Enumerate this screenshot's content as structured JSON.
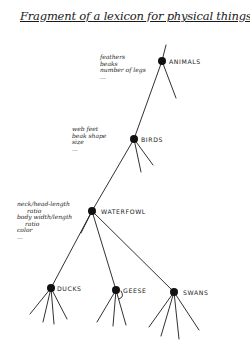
{
  "title": "Fragment of a lexicon for physical things",
  "nodes": {
    "animals": {
      "label": "ANIMALS",
      "attributes": [
        "feathers",
        "beaks",
        "number of legs",
        "..."
      ]
    },
    "birds": {
      "label": "BIRDS",
      "attributes": [
        "web feet",
        "beak shape",
        "size",
        "..."
      ]
    },
    "waterfowl": {
      "label": "WATERFOWL",
      "attributes": [
        "neck/head-length",
        "ratio",
        "body width/length",
        "ratio",
        "color",
        "..."
      ]
    },
    "ducks": {
      "label": "DUCKS"
    },
    "geese": {
      "label": "GEESE"
    },
    "swans": {
      "label": "SWANS"
    }
  },
  "colors": {
    "ink": "#111111",
    "background": "#ffffff"
  }
}
